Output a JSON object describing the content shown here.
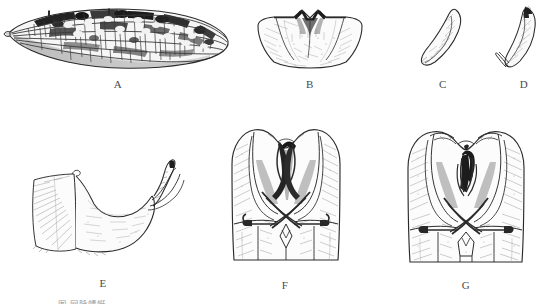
{
  "plate": {
    "type": "scientific-illustration-plate",
    "background_color": "#ffffff",
    "ink_color": "#2b2b2b",
    "width": 548,
    "height": 304,
    "caption": "图   网脉蜻蜓",
    "panels": [
      {
        "id": "A",
        "label": "A",
        "name": "forewing",
        "description": "Mottled insect wing with dark pigment patches and pale venation cells",
        "label_x": 118,
        "label_y": 84
      },
      {
        "id": "B",
        "label": "B",
        "name": "pronotum-sclerite",
        "description": "Trapezoidal sclerite with notched dark dorsal margin and fine setae",
        "label_x": 310,
        "label_y": 84
      },
      {
        "id": "C",
        "label": "C",
        "name": "lateral-appendage",
        "description": "Narrow curved sickle-shaped appendage, lateral view",
        "label_x": 443,
        "label_y": 84
      },
      {
        "id": "D",
        "label": "D",
        "name": "lateral-appendage-alt",
        "description": "Curved appendage with accessory basal branch, lateral view",
        "label_x": 524,
        "label_y": 84
      },
      {
        "id": "E",
        "label": "E",
        "name": "abdominal-segment-lateral",
        "description": "Lateral view of terminal abdominal segment with hooked cercus",
        "label_x": 103,
        "label_y": 283
      },
      {
        "id": "F",
        "label": "F",
        "name": "genitalia-ventral-one",
        "description": "Ventral view of male genitalia with crossed dark parameres",
        "label_x": 285,
        "label_y": 285
      },
      {
        "id": "G",
        "label": "G",
        "name": "genitalia-ventral-two",
        "description": "Ventral view of male genitalia of second species, crossed parameres",
        "label_x": 466,
        "label_y": 285
      }
    ]
  }
}
